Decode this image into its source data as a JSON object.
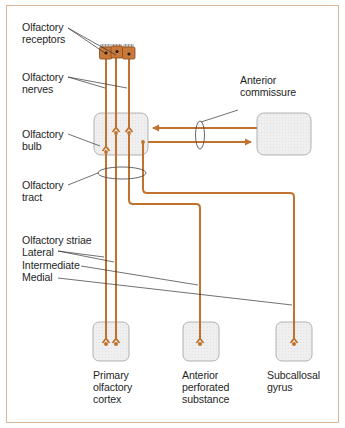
{
  "diagram": {
    "colors": {
      "pathway": "#c0722e",
      "pathway_dark": "#8a4a1a",
      "receptor_fill": "#c97a3a",
      "receptor_border": "#8a4a1a",
      "nucleus": "#2a1a10",
      "box_fill": "#ececec",
      "box_border": "#a9a9a9",
      "leader_line": "#333333",
      "frame_border": "#d9b79a",
      "text": "#1f1f1f"
    },
    "labels": {
      "olfactory_receptors": "Olfactory\nreceptors",
      "olfactory_nerves": "Olfactory\nnerves",
      "olfactory_bulb": "Olfactory\nbulb",
      "olfactory_tract": "Olfactory\ntract",
      "olfactory_striae": "Olfactory striae",
      "lateral": "Lateral",
      "intermediate": "Intermediate",
      "medial": "Medial",
      "anterior_commissure": "Anterior\ncommissure",
      "primary_olfactory_cortex": "Primary\nolfactory\ncortex",
      "anterior_perforated_substance": "Anterior\nperforated\nsubstance",
      "subcallosal_gyrus": "Subcallosal\ngyrus"
    },
    "structures": [
      {
        "id": "olfactory-receptors",
        "label": "Olfactory receptors",
        "count": 3
      },
      {
        "id": "olfactory-bulb",
        "label": "Olfactory bulb"
      },
      {
        "id": "contralateral-bulb",
        "label": ""
      },
      {
        "id": "primary-olfactory-cortex",
        "label": "Primary olfactory cortex"
      },
      {
        "id": "anterior-perforated-substance",
        "label": "Anterior perforated substance"
      },
      {
        "id": "subcallosal-gyrus",
        "label": "Subcallosal gyrus"
      }
    ],
    "connections": [
      {
        "from": "olfactory-receptors",
        "to": "olfactory-bulb",
        "via": "Olfactory nerves"
      },
      {
        "from": "olfactory-bulb",
        "to": "primary-olfactory-cortex",
        "via": "Lateral olfactory stria"
      },
      {
        "from": "olfactory-bulb",
        "to": "anterior-perforated-substance",
        "via": "Intermediate olfactory stria"
      },
      {
        "from": "olfactory-bulb",
        "to": "subcallosal-gyrus",
        "via": "Medial olfactory stria"
      },
      {
        "from": "olfactory-bulb",
        "to": "contralateral-bulb",
        "via": "Anterior commissure"
      },
      {
        "from": "contralateral-bulb",
        "to": "olfactory-bulb",
        "via": "Anterior commissure"
      }
    ]
  }
}
